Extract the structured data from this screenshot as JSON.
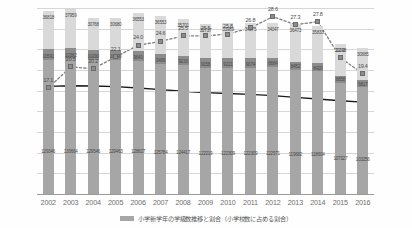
{
  "chart_data": {
    "type": "bar",
    "title": "",
    "xlabel": "",
    "ylabel": "",
    "y2label": "",
    "grid": true,
    "legend_position": "bottom",
    "categories": [
      "2002",
      "2003",
      "2004",
      "2005",
      "2006",
      "2007",
      "2008",
      "2009",
      "2010",
      "2011",
      "2012",
      "2013",
      "2014",
      "2015",
      "2016"
    ],
    "ylim": [
      0,
      180000
    ],
    "y2lim": [
      0,
      30
    ],
    "yticks": [
      "180,000",
      "160,000",
      "140,000",
      "120,000",
      "100,000",
      "80,000",
      "60,000",
      "40,000",
      "20,000",
      "0"
    ],
    "y2ticks": [
      "30.0%",
      "25.0%",
      "20.0%",
      "15.0%",
      "10.0%",
      "5.0%",
      "0.0%"
    ],
    "series": [
      {
        "name": "bottom-segment",
        "type": "bar-stack",
        "values": [
          129346,
          130664,
          129546,
          129463,
          128827,
          125784,
          124417,
          122219,
          122309,
          122309,
          122571,
          119682,
          118604,
          107327,
          103256
        ],
        "labels": [
          "129346",
          "130664",
          "129546",
          "129463",
          "128827",
          "125784",
          "124417",
          "122219",
          "122309",
          "122309",
          "122571",
          "119682",
          "118604",
          "107327",
          "103256"
        ]
      },
      {
        "name": "middle-segment",
        "type": "bar-stack",
        "values": [
          10591,
          10382,
          10290,
          10090,
          9640,
          9489,
          9233,
          9158,
          9221,
          9074,
          8884,
          8452,
          8420,
          6858,
          6817
        ],
        "labels": [
          "10591",
          "10382",
          "10290",
          "10090",
          "9640",
          "9489",
          "9233",
          "9158",
          "9221",
          "9074",
          "8884",
          "8452",
          "8420",
          "6858",
          "6817"
        ]
      },
      {
        "name": "top-segment",
        "type": "bar-stack",
        "values": [
          36818,
          37959,
          30768,
          30680,
          36553,
          36553,
          35701,
          32737,
          33989,
          34575,
          34047,
          36473,
          35833,
          31098,
          30885
        ],
        "labels": [
          "36818",
          "37959",
          "30768",
          "30680",
          "36553",
          "36553",
          "35701",
          "32737",
          "33989",
          "34575",
          "34047",
          "36473",
          "35833",
          "31098",
          "30885"
        ]
      },
      {
        "name": "ratio-line",
        "type": "line-dotted-marker",
        "axis": "right",
        "values": [
          17.1,
          20.5,
          20.2,
          22.1,
          24.0,
          24.6,
          25.5,
          25.5,
          25.8,
          26.8,
          28.6,
          27.3,
          27.8,
          22.0,
          19.4
        ],
        "labels": [
          "17.1",
          "20.5",
          "20.2",
          "22.1",
          "24.0",
          "24.6",
          "25.5",
          "25.5",
          "25.8",
          "26.8",
          "28.6",
          "27.3",
          "27.8",
          "22.0",
          "19.4"
        ]
      },
      {
        "name": "trend-line",
        "type": "line-solid",
        "axis": "left",
        "values": [
          104200,
          104700,
          104500,
          103900,
          102600,
          101000,
          99400,
          98100,
          97200,
          96400,
          95200,
          93500,
          92000,
          90300,
          88900
        ],
        "labels": []
      }
    ]
  },
  "legend": {
    "swatch_name": "bar-swatch",
    "text": "小学新学年の学級数推移と割合（小学校数に占める割合）"
  }
}
